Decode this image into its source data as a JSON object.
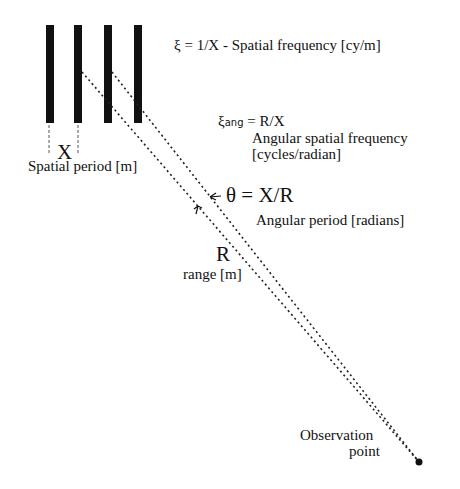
{
  "diagram": {
    "grating": {
      "bar_count": 4,
      "period_symbol": "X",
      "period_label": "Spatial period [m]"
    },
    "spatial_frequency": {
      "symbol": "ξ",
      "formula": " = 1/X - Spatial frequency [cy/m]"
    },
    "angular_frequency": {
      "symbol": "ξ",
      "subscript": "ang",
      "formula": " = R/X",
      "label_line1": "Angular spatial frequency",
      "label_line2": "[cycles/radian]"
    },
    "angular_period": {
      "formula": "θ = X/R",
      "label": "Angular period [radians]"
    },
    "range": {
      "symbol": "R",
      "label": "range [m]"
    },
    "observation_point": {
      "line1": "Observation",
      "line2": "point"
    }
  }
}
